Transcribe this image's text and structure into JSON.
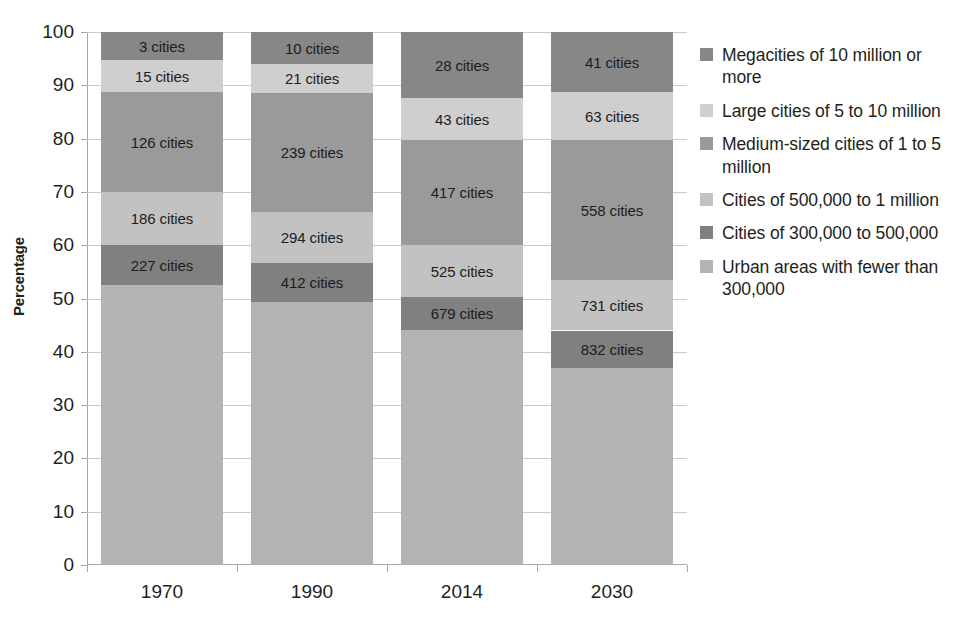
{
  "chart_data": {
    "type": "bar",
    "subtype": "stacked-percentage",
    "title": "",
    "xlabel": "",
    "ylabel": "Percentage",
    "ylim": [
      0,
      100
    ],
    "yticks": [
      0,
      10,
      20,
      30,
      40,
      50,
      60,
      70,
      80,
      90,
      100
    ],
    "grid": true,
    "legend_position": "right",
    "categories": [
      "1970",
      "1990",
      "2014",
      "2030"
    ],
    "series": [
      {
        "name": "Megacities of 10 million or more",
        "color": "#878787",
        "values": [
          5.3,
          6.0,
          12.4,
          11.3
        ],
        "labels": [
          "3 cities",
          "10 cities",
          "28 cities",
          "41 cities"
        ]
      },
      {
        "name": "Large cities of 5 to 10 million",
        "color": "#cfcfcf",
        "values": [
          6.0,
          5.5,
          7.9,
          9.0
        ],
        "labels": [
          "15 cities",
          "21 cities",
          "43 cities",
          "63 cities"
        ]
      },
      {
        "name": "Medium-sized cities of 1 to 5 million",
        "color": "#9a9a9a",
        "values": [
          18.7,
          22.3,
          19.7,
          26.3
        ],
        "labels": [
          "126 cities",
          "239 cities",
          "417 cities",
          "558 cities"
        ]
      },
      {
        "name": "Cities of 500,000 to 1 million",
        "color": "#c2c2c2",
        "values": [
          10.0,
          9.6,
          9.7,
          9.4
        ],
        "labels": [
          "186 cities",
          "294 cities",
          "525 cities",
          "731 cities"
        ]
      },
      {
        "name": "Cities of 300,000 to 500,000",
        "color": "#808080",
        "values": [
          7.5,
          7.3,
          6.3,
          7.1
        ],
        "labels": [
          "227 cities",
          "412 cities",
          "679 cities",
          "832 cities"
        ]
      },
      {
        "name": "Urban areas with fewer than 300,000",
        "color": "#b3b3b3",
        "values": [
          52.5,
          49.3,
          44.0,
          36.9
        ],
        "labels": [
          "",
          "",
          "",
          ""
        ]
      }
    ]
  },
  "axis": {
    "y_title": "Percentage",
    "y_tick_labels": [
      "100",
      "90",
      "80",
      "70",
      "60",
      "50",
      "40",
      "30",
      "20",
      "10",
      "0"
    ],
    "x_tick_labels": [
      "1970",
      "1990",
      "2014",
      "2030"
    ]
  },
  "legend": {
    "items": [
      {
        "label": "Megacities of 10 million or more",
        "color": "#878787"
      },
      {
        "label": "Large cities of 5 to 10 million",
        "color": "#cfcfcf"
      },
      {
        "label": "Medium-sized cities of 1 to 5 million",
        "color": "#9a9a9a"
      },
      {
        "label": "Cities of 500,000 to 1 million",
        "color": "#c2c2c2"
      },
      {
        "label": "Cities of 300,000 to 500,000",
        "color": "#808080"
      },
      {
        "label": "Urban areas with fewer than 300,000",
        "color": "#b3b3b3"
      }
    ]
  }
}
